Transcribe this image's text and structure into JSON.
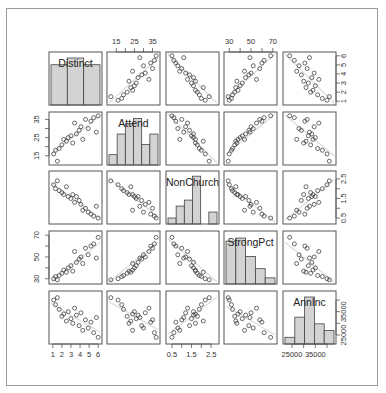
{
  "chart_data": {
    "type": "scatter",
    "title": "",
    "subtitle": "Scatterplot matrix with histograms on diagonal",
    "variables": [
      "Distinct",
      "Attend",
      "NonChurch",
      "StrongPct",
      "AnnInc"
    ],
    "axes": {
      "Distinct": {
        "range": [
          0.8,
          6.2
        ],
        "ticks": [
          1,
          2,
          3,
          4,
          5,
          6
        ],
        "tick_labels": [
          "1",
          "2",
          "3",
          "4",
          "5",
          "6"
        ],
        "label_side": "bottom/right"
      },
      "Attend": {
        "range": [
          11,
          38
        ],
        "ticks": [
          15,
          20,
          25,
          30,
          35
        ],
        "tick_labels": [
          "15",
          "",
          "25",
          "",
          "35"
        ],
        "label_side": "top/left"
      },
      "NonChurch": {
        "range": [
          0.3,
          2.8
        ],
        "ticks": [
          0.5,
          1.0,
          1.5,
          2.0,
          2.5
        ],
        "tick_labels": [
          "0.5",
          "",
          "1.5",
          "",
          "2.5"
        ],
        "label_side": "bottom/right"
      },
      "StrongPct": {
        "range": [
          27,
          72
        ],
        "ticks": [
          30,
          40,
          50,
          60,
          70
        ],
        "tick_labels": [
          "30",
          "",
          "50",
          "",
          "70"
        ],
        "label_side": "top/left"
      },
      "AnnInc": {
        "range": [
          22000,
          43000
        ],
        "ticks": [
          25000,
          30000,
          35000,
          40000
        ],
        "tick_labels": [
          "25000",
          "",
          "35000",
          ""
        ],
        "label_side": "bottom/right"
      }
    },
    "histograms": {
      "Distinct": {
        "bins": [
          1,
          2.67,
          4.33,
          6
        ],
        "counts": [
          6,
          7,
          6
        ],
        "max": 7.3
      },
      "Attend": {
        "bins": [
          10,
          15,
          20,
          25,
          30,
          35,
          40
        ],
        "counts": [
          2,
          6,
          8,
          9,
          4,
          6
        ],
        "max": 9.5
      },
      "NonChurch": {
        "bins": [
          0,
          0.5,
          1.0,
          1.5,
          2.0,
          2.5,
          3.0
        ],
        "counts": [
          1,
          3,
          4,
          8,
          0,
          2
        ],
        "max": 8.2
      },
      "StrongPct": {
        "bins": [
          20,
          30,
          40,
          50,
          60,
          70,
          80
        ],
        "counts": [
          7,
          7.5,
          4.5,
          2.5,
          1
        ],
        "max": 8
      },
      "AnnInc": {
        "bins": [
          20000,
          25000,
          30000,
          35000,
          40000,
          45000
        ],
        "counts": [
          1,
          4,
          7,
          3,
          2
        ],
        "max": 7.3
      }
    },
    "observations": {
      "Distinct": [
        1.1,
        1.3,
        1.5,
        1.7,
        2.0,
        2.2,
        2.5,
        2.7,
        3.0,
        3.2,
        3.4,
        3.6,
        3.9,
        4.1,
        4.3,
        4.6,
        4.9,
        5.2,
        5.5,
        5.8,
        6.0
      ],
      "Attend": [
        16,
        18,
        12,
        19,
        21,
        24,
        23,
        25,
        26,
        22,
        33,
        27,
        29,
        31,
        24,
        35,
        30,
        34,
        36,
        28,
        37
      ],
      "NonChurch": [
        2.2,
        2.0,
        2.4,
        1.9,
        1.8,
        1.7,
        2.1,
        1.6,
        1.5,
        1.7,
        1.3,
        1.6,
        1.4,
        1.2,
        0.9,
        1.0,
        0.8,
        0.7,
        0.6,
        1.1,
        0.5
      ],
      "StrongPct": [
        30,
        32,
        29,
        33,
        35,
        38,
        36,
        40,
        42,
        37,
        55,
        45,
        48,
        50,
        44,
        58,
        52,
        60,
        62,
        49,
        68
      ],
      "AnnInc": [
        40000,
        38000,
        41000,
        36000,
        33000,
        34000,
        31000,
        35000,
        32000,
        30000,
        36500,
        33500,
        29000,
        34500,
        27000,
        31500,
        28000,
        30500,
        26000,
        32500,
        24000
      ]
    },
    "lower_upper_note": "Off-diagonal panels show pairwise scatter with light grey linear fit line",
    "grid": false,
    "legend": null
  }
}
